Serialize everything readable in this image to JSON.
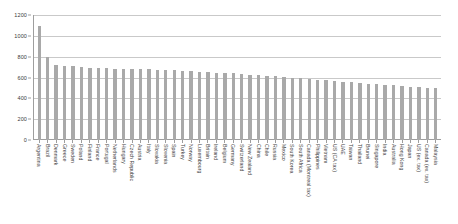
{
  "chart_data": {
    "type": "bar",
    "title": "",
    "subtitle": "",
    "xlabel": "",
    "ylabel": "",
    "ylim": [
      0,
      1200
    ],
    "ytick_values": [
      0,
      200,
      400,
      600,
      800,
      1000,
      1200
    ],
    "ytick_labels": [
      "0",
      "200",
      "400",
      "600",
      "800",
      "1000",
      "1200"
    ],
    "grid": true,
    "grid_axis": "y",
    "legend": false,
    "legend_position": "none",
    "bar_color": "#a9a9a9",
    "categories": [
      "Argentina",
      "Brazil",
      "Denmark",
      "Greece",
      "Sweden",
      "Poland",
      "Finland",
      "France",
      "Portugal",
      "Netherlands",
      "Hungary",
      "Czech Republic",
      "Austria",
      "Italy",
      "Slovakia",
      "Slovenia",
      "Spain",
      "Turkey",
      "Norway",
      "Luxembourg",
      "Britain",
      "Ireland",
      "Belgium",
      "Germany",
      "Switzerland",
      "New Zealand",
      "China",
      "Chile",
      "Russia",
      "Mexico",
      "South Korea",
      "South Africa",
      "Canada (Montreal tax)",
      "Philippines",
      "Vietnam",
      "US (CA tax)",
      "UAE",
      "Taiwan",
      "Thailand",
      "Brunei",
      "Singapore",
      "India",
      "Australia",
      "Hong Kong",
      "Japan",
      "US (ex. tax)",
      "Canada (ex. tax)",
      "Malaysia"
    ],
    "values": [
      1090,
      800,
      720,
      712,
      706,
      700,
      696,
      692,
      688,
      686,
      684,
      682,
      680,
      678,
      676,
      672,
      668,
      664,
      660,
      656,
      652,
      648,
      644,
      640,
      634,
      628,
      622,
      616,
      610,
      604,
      598,
      592,
      586,
      580,
      574,
      566,
      560,
      554,
      548,
      542,
      536,
      530,
      524,
      518,
      512,
      508,
      504,
      498
    ]
  }
}
